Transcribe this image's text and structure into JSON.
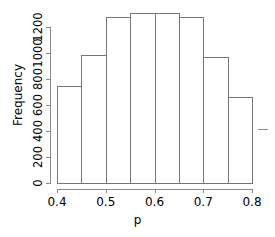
{
  "chart_data": {
    "type": "bar",
    "title": "",
    "subtitle": "",
    "xlabel": "p",
    "ylabel": "Frequency",
    "categories": [
      "0.40-0.45",
      "0.45-0.50",
      "0.50-0.55",
      "0.55-0.60",
      "0.60-0.65",
      "0.65-0.70",
      "0.70-0.75",
      "0.75-0.80"
    ],
    "bin_edges": [
      0.4,
      0.45,
      0.5,
      0.55,
      0.6,
      0.65,
      0.7,
      0.75,
      0.8
    ],
    "values": [
      750,
      985,
      1277,
      1308,
      1308,
      1277,
      969,
      661
    ],
    "xlim": [
      0.4,
      0.8
    ],
    "ylim": [
      0,
      1300
    ],
    "xticks": [
      "0.4",
      "0.5",
      "0.6",
      "0.7",
      "0.8"
    ],
    "xtick_values": [
      0.4,
      0.5,
      0.6,
      0.7,
      0.8
    ],
    "yticks": [
      "0",
      "200",
      "400",
      "600",
      "800",
      "1000",
      "1200"
    ],
    "ytick_values": [
      0,
      200,
      400,
      600,
      800,
      1000,
      1200
    ],
    "grid": false,
    "legend": null,
    "bar_edge_color": "#767676",
    "bar_fill_color": "transparent",
    "axis_color": "#8a8a8a"
  },
  "axes": {
    "y_axis_title": "Frequency",
    "x_axis_title": "p"
  }
}
